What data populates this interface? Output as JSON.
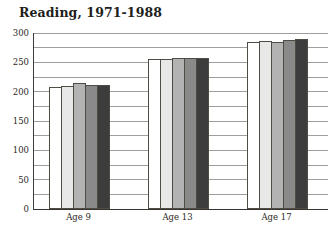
{
  "figure": {
    "title": "Reading, 1971-1988"
  },
  "colors": {
    "background": "#ffffff",
    "axis_line": "#3b3b3b",
    "gridline": "#9e9e9e",
    "text": "#211e1b",
    "bar_border": "#4f4b45",
    "bar_fills": [
      "#ffffff",
      "#e8e8e8",
      "#b3b3b3",
      "#8a8a8a",
      "#3d3d3d"
    ]
  },
  "chart_data": {
    "type": "bar",
    "title": "Reading, 1971-1988",
    "categories": [
      "Age 9",
      "Age 13",
      "Age 17"
    ],
    "series": [
      {
        "name": "1971",
        "values": [
          208,
          255,
          285
        ]
      },
      {
        "name": "1975",
        "values": [
          210,
          256,
          286
        ]
      },
      {
        "name": "1980",
        "values": [
          215,
          258,
          285
        ]
      },
      {
        "name": "1984",
        "values": [
          211,
          257,
          289
        ]
      },
      {
        "name": "1988",
        "values": [
          212,
          257,
          290
        ]
      }
    ],
    "xlabel": "",
    "ylabel": "",
    "ylim": [
      0,
      300
    ],
    "yticks_labeled": [
      0,
      50,
      100,
      150,
      200,
      250,
      300
    ],
    "gridline_interval": 25,
    "grid": true,
    "legend_position": "none"
  }
}
